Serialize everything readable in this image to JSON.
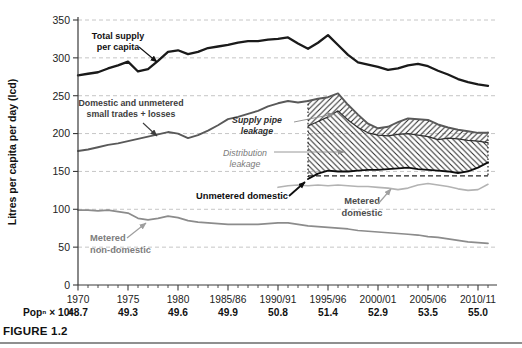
{
  "figure": {
    "caption": "FIGURE 1.2"
  },
  "chart_data": {
    "type": "line",
    "title": "",
    "xlabel": "",
    "ylabel": "Litres per capita per day (lcd)",
    "ylim": [
      0,
      350
    ],
    "ytick_interval": 50,
    "grid": "horizontal-dashed",
    "grid_color": "#c6c6c6",
    "axis_color": "#3a3a3a",
    "tick_label_color": "#222222",
    "x_tick_labels": [
      "1970",
      "1975",
      "1980",
      "1985/86",
      "1990/91",
      "1995/96",
      "2000/01",
      "2005/06",
      "2010/11"
    ],
    "x_tick_years": [
      1970,
      1975,
      1980,
      1985,
      1990,
      1995,
      2000,
      2005,
      2010
    ],
    "x_minor_tick_step": 1,
    "population_row": {
      "label": "Popⁿ × 10⁶",
      "values": [
        "48.7",
        "49.3",
        "49.6",
        "49.9",
        "50.8",
        "51.4",
        "52.9",
        "53.5",
        "55.0"
      ]
    },
    "series": [
      {
        "id": "total-supply",
        "name": "Total supply per capita",
        "start_year": 1970,
        "color": "#1a1a1a",
        "width": 2.3,
        "values": [
          277,
          279,
          281,
          286,
          290,
          295,
          282,
          285,
          296,
          308,
          310,
          305,
          308,
          313,
          315,
          317,
          320,
          322,
          322,
          324,
          325,
          327,
          319,
          312,
          320,
          330,
          317,
          304,
          294,
          291,
          288,
          284,
          286,
          290,
          292,
          289,
          283,
          278,
          272,
          268,
          265,
          263
        ]
      },
      {
        "id": "domestic-unmetered",
        "name": "Domestic and unmetered small trades + losses",
        "start_year": 1970,
        "color": "#595959",
        "width": 1.9,
        "values": [
          177,
          179,
          182,
          185,
          187,
          190,
          193,
          196,
          199,
          202,
          200,
          194,
          198,
          204,
          211,
          219,
          222,
          226,
          230,
          236,
          240,
          243,
          241,
          243,
          246,
          248,
          253,
          238,
          225,
          213,
          207,
          209,
          215,
          220,
          219,
          218,
          212,
          208,
          205,
          203,
          201,
          201
        ]
      },
      {
        "id": "metered-non-domestic",
        "name": "Metered non-domestic",
        "start_year": 1970,
        "color": "#8c8c8c",
        "width": 1.7,
        "values": [
          99,
          99,
          98,
          99,
          97,
          95,
          88,
          86,
          88,
          91,
          89,
          85,
          83,
          82,
          81,
          80,
          80,
          80,
          80,
          81,
          82,
          82,
          80,
          78,
          77,
          76,
          75,
          74,
          72,
          71,
          70,
          69,
          68,
          67,
          66,
          64,
          63,
          61,
          59,
          57,
          56,
          55
        ]
      },
      {
        "id": "metered-domestic",
        "name": "Metered domestic",
        "start_year": 1990,
        "color": "#b3b3b3",
        "width": 1.6,
        "values": [
          129,
          131,
          132,
          131,
          132,
          131,
          132,
          131,
          130,
          130,
          129,
          128,
          126,
          128,
          132,
          134,
          132,
          130,
          127,
          125,
          126,
          133
        ]
      },
      {
        "id": "unmetered-domestic",
        "name": "Unmetered domestic",
        "start_year": 1993,
        "color": "#0d0d0d",
        "width": 1.9,
        "values": [
          140,
          147,
          151,
          150,
          150,
          151,
          152,
          152,
          153,
          154,
          155,
          153,
          152,
          151,
          150,
          148,
          150,
          155,
          162
        ]
      },
      {
        "id": "leakage-boundary",
        "name": "",
        "start_year": 1993,
        "color": "#2e2e2e",
        "width": 1.2,
        "values": [
          210,
          216,
          222,
          230,
          218,
          208,
          201,
          198,
          197,
          199,
          200,
          198,
          196,
          192,
          194,
          193,
          191,
          190,
          188
        ]
      }
    ],
    "leakage_bands": {
      "start_year": 1993,
      "end_year": 2011,
      "upper": {
        "name": "Supply pipe leakage",
        "top_series": "domestic-unmetered",
        "bottom_series": "leakage-boundary",
        "hatch": "/"
      },
      "lower": {
        "name": "Distribution leakage",
        "top_series": "leakage-boundary",
        "bottom_series": "unmetered-domestic",
        "hatch": "\\"
      },
      "hatch_color": "#2b2b2b",
      "hatch_spacing": 5.5,
      "box": {
        "bottom_value": 144,
        "edge_style": "dotted",
        "bottom_style": "dashed",
        "color": "#222222"
      }
    },
    "annotations": [
      {
        "id": "total-supply-label",
        "lines": [
          "Total supply",
          "per capita"
        ],
        "x": 118,
        "y": 39,
        "lh": 11,
        "bold": true,
        "italic": false,
        "color": "#111111",
        "size": 9,
        "anchor": "middle",
        "arrow": {
          "x1": 139,
          "y1": 47,
          "x2": 157,
          "y2": 62,
          "color": "#111111",
          "width": 1.1
        }
      },
      {
        "id": "domestic-label",
        "lines": [
          "Domestic and unmetered",
          "small trades + losses"
        ],
        "x": 131,
        "y": 106,
        "lh": 11,
        "bold": true,
        "italic": false,
        "color": "#3d3d3d",
        "size": 8.8,
        "anchor": "middle",
        "arrow": {
          "x1": 143,
          "y1": 123,
          "x2": 157,
          "y2": 136,
          "color": "#3d3d3d",
          "width": 1.1
        }
      },
      {
        "id": "supply-pipe-leakage-label",
        "lines": [
          "Supply pipe",
          "leakage"
        ],
        "x": 257,
        "y": 123,
        "lh": 11,
        "bold": true,
        "italic": true,
        "color": "#2e2e2e",
        "size": 8.8,
        "anchor": "middle",
        "arrow": {
          "x1": 294,
          "y1": 122,
          "x2": 334,
          "y2": 114,
          "color": "#8c8c8c",
          "width": 0.9
        }
      },
      {
        "id": "distribution-leakage-label",
        "lines": [
          "Distribution",
          "leakage"
        ],
        "x": 245,
        "y": 156,
        "lh": 11,
        "bold": false,
        "italic": true,
        "color": "#7a7a7a",
        "size": 8.8,
        "anchor": "middle",
        "arrow": {
          "x1": 274,
          "y1": 152,
          "x2": 344,
          "y2": 152,
          "color": "#8c8c8c",
          "width": 0.9
        }
      },
      {
        "id": "unmetered-domestic-label",
        "lines": [
          "Unmetered domestic"
        ],
        "x": 242,
        "y": 199,
        "lh": 11,
        "bold": true,
        "italic": false,
        "color": "#0d0d0d",
        "size": 9.3,
        "anchor": "middle",
        "arrow": {
          "x1": 289,
          "y1": 196,
          "x2": 305,
          "y2": 182,
          "color": "#0d0d0d",
          "width": 1.8
        }
      },
      {
        "id": "metered-domestic-label",
        "lines": [
          "Metered",
          "domestic"
        ],
        "x": 362,
        "y": 204,
        "lh": 12,
        "bold": true,
        "italic": false,
        "color": "#4d4d4d",
        "size": 9.3,
        "anchor": "middle",
        "arrow": {
          "x1": 378,
          "y1": 204,
          "x2": 391,
          "y2": 189,
          "color": "#a0a0a0",
          "width": 1.2
        }
      },
      {
        "id": "metered-non-domestic-label",
        "lines": [
          "Metered",
          "non-domestic"
        ],
        "x": 90,
        "y": 241,
        "lh": 11.5,
        "bold": true,
        "italic": false,
        "color": "#7d7d7d",
        "size": 9.3,
        "anchor": "start",
        "arrow": {
          "x1": 127,
          "y1": 238,
          "x2": 146,
          "y2": 223,
          "color": "#9e9e9e",
          "width": 1.2
        }
      }
    ]
  }
}
